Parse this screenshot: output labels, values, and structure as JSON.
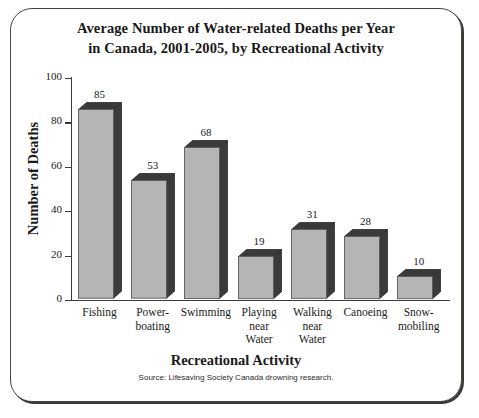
{
  "chart_data": {
    "type": "bar",
    "title": "Average Number of Water-related Deaths per Year in Canada, 2001-2005, by Recreational Activity",
    "title_lines": [
      "Average Number of Water-related Deaths per Year",
      "in Canada, 2001-2005, by Recreational Activity"
    ],
    "xlabel": "Recreational Activity",
    "ylabel": "Number of Deaths",
    "source": "Source: Lifesaving Society Canada drowning research.",
    "categories": [
      "Fishing",
      "Power-boating",
      "Swimming",
      "Playing near Water",
      "Walking near Water",
      "Canoeing",
      "Snow-mobiling"
    ],
    "category_lines": [
      [
        "Fishing"
      ],
      [
        "Power-",
        "boating"
      ],
      [
        "Swimming"
      ],
      [
        "Playing",
        "near",
        "Water"
      ],
      [
        "Walking",
        "near",
        "Water"
      ],
      [
        "Canoeing"
      ],
      [
        "Snow-",
        "mobiling"
      ]
    ],
    "values": [
      85,
      53,
      68,
      19,
      31,
      28,
      10
    ],
    "value_labels": [
      "85",
      "53",
      "68",
      "19",
      "31",
      "28",
      "10"
    ],
    "ylim": [
      0,
      100
    ],
    "yticks": [
      0,
      20,
      40,
      60,
      80,
      100
    ],
    "ytick_labels": [
      "0",
      "20",
      "40",
      "60",
      "80",
      "100"
    ],
    "grid": false,
    "legend": "none",
    "style": "3d-bar",
    "colors": {
      "bar_front": "#b5b5b5",
      "bar_shade": "#3a3a3a",
      "axis": "#3c3c3a",
      "frame": "#45443f",
      "background": "#ffffff",
      "text": "#1a1a1a"
    }
  }
}
